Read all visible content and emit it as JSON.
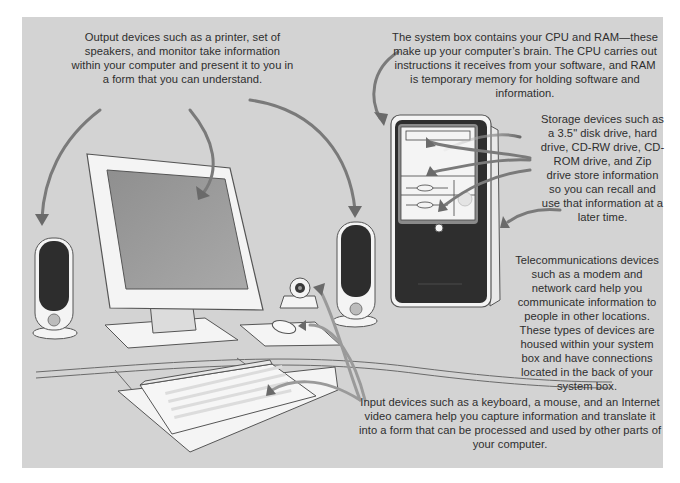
{
  "figure": {
    "background_color": "#d3d3d3",
    "arrow_color": "#6e6e6e"
  },
  "annotations": {
    "output": {
      "label": "Output devices",
      "text": "Output devices such as a printer, set of speakers, and monitor take information within your computer and present it to you in a form that you can understand."
    },
    "system_box": {
      "label": "System box",
      "text": "The system box contains your CPU and RAM—these make up your computer’s brain. The CPU carries out instructions it receives from your software, and RAM is temporary memory for holding software and information."
    },
    "storage": {
      "label": "Storage devices",
      "text": "Storage devices such as a 3.5\" disk drive, hard drive, CD-RW drive, CD-ROM drive, and Zip drive store information so you can recall and use that information at a later time."
    },
    "telecom": {
      "label": "Telecommunications devices",
      "text": "Telecommunications devices such as a modem and network card help you communicate information to people in other locations.  These types of devices are housed within your system box and have connections located in the back of your system box."
    },
    "input": {
      "label": "Input devices",
      "text": "Input devices such as a keyboard, a mouse, and an Internet video camera help you capture information and translate it into a form that can be processed and used by other parts of your computer."
    }
  },
  "components": [
    {
      "name": "left-speaker",
      "category": "output"
    },
    {
      "name": "monitor",
      "category": "output"
    },
    {
      "name": "right-speaker",
      "category": "output"
    },
    {
      "name": "web-camera",
      "category": "input"
    },
    {
      "name": "mouse",
      "category": "input"
    },
    {
      "name": "keyboard",
      "category": "input"
    },
    {
      "name": "system-box",
      "category": "system"
    },
    {
      "name": "drive-bays",
      "category": "storage"
    }
  ]
}
